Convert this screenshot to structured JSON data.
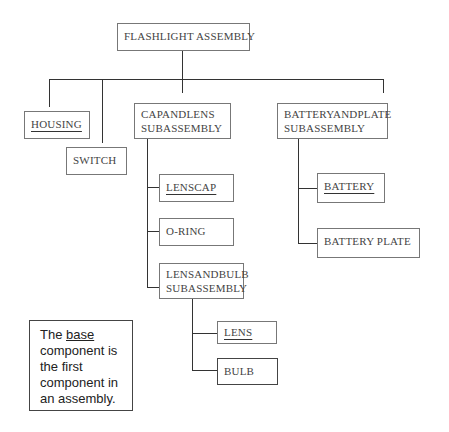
{
  "diagram": {
    "root": {
      "label": "FLASHLIGHT ASSEMBLY"
    },
    "level1": {
      "housing": {
        "label": "HOUSING",
        "underlined": true
      },
      "switch": {
        "label": "SWITCH"
      },
      "cap_and_lens": {
        "line1": "CAPANDLENS",
        "line2": "SUBASSEMBLY"
      },
      "battery_and_plate": {
        "line1": "BATTERYANDPLATE",
        "line2": "SUBASSEMBLY"
      }
    },
    "cap_and_lens_children": {
      "lenscap": {
        "label": "LENSCAP",
        "underlined": true
      },
      "oring": {
        "label": "O-RING"
      },
      "lens_and_bulb": {
        "line1": "LENSANDBULB",
        "line2": "SUBASSEMBLY"
      }
    },
    "lens_and_bulb_children": {
      "lens": {
        "label": "LENS",
        "underlined": true
      },
      "bulb": {
        "label": "BULB"
      }
    },
    "battery_and_plate_children": {
      "battery": {
        "label": "BATTERY",
        "underlined": true
      },
      "battery_plate": {
        "label": "BATTERY PLATE"
      }
    }
  },
  "note": {
    "prefix": "The ",
    "emphasis": "base",
    "rest_line1": "component is",
    "line2": "the first",
    "line3": "component in",
    "line4": "an assembly."
  }
}
